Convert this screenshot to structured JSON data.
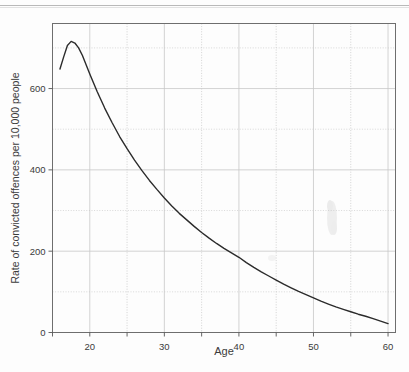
{
  "figure": {
    "name": "age-crime-curve-figure",
    "background_color": "#fdfdfd",
    "artifact_note": ""
  },
  "chart_data": {
    "type": "line",
    "title": "",
    "xlabel": "Age",
    "ylabel": "Rate of convicted offences per 10,000 people",
    "xlim": [
      15,
      61
    ],
    "ylim": [
      0,
      760
    ],
    "x_ticks": [
      20,
      30,
      40,
      50,
      60
    ],
    "x_tick_labels": [
      "20",
      "30",
      "40",
      "50",
      "60"
    ],
    "x_minor_ticks": [
      15,
      25,
      35,
      45,
      55
    ],
    "y_ticks": [
      0,
      200,
      400,
      600
    ],
    "y_tick_labels": [
      "0",
      "200",
      "400",
      "600"
    ],
    "y_gridlines": [
      0,
      100,
      200,
      300,
      400,
      500,
      600,
      700
    ],
    "grid": true,
    "grid_color": "#c8c8c8",
    "frame_color": "#6e6e6e",
    "series": [
      {
        "name": "Rate of convicted offences",
        "color": "#2b2b2b",
        "line_width": 1.4,
        "x": [
          16,
          16.5,
          17,
          17.5,
          18,
          18.5,
          19,
          20,
          21,
          22,
          23,
          24,
          25,
          26,
          27,
          28,
          29,
          30,
          31,
          32,
          33,
          34,
          35,
          36,
          37,
          38,
          39,
          40,
          41,
          42,
          43,
          44,
          45,
          46,
          47,
          48,
          49,
          50,
          51,
          52,
          53,
          54,
          55,
          56,
          57,
          58,
          59,
          60
        ],
        "y": [
          648,
          678,
          706,
          716,
          712,
          700,
          682,
          636,
          592,
          552,
          516,
          482,
          452,
          424,
          398,
          374,
          352,
          331,
          311,
          293,
          277,
          261,
          246,
          232,
          219,
          207,
          196,
          185,
          172,
          160,
          149,
          139,
          129,
          119,
          110,
          101,
          93,
          85,
          77,
          70,
          63,
          57,
          51,
          45,
          40,
          34,
          28,
          22
        ]
      }
    ],
    "annotations": []
  }
}
